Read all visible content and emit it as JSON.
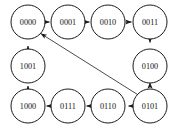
{
  "diagram": {
    "background_color": "#ffffff",
    "stroke_color": "#1a1a1a",
    "label_color": "#111111",
    "node_radius": 17,
    "nodes": [
      {
        "id": "n0000",
        "label": "0000",
        "cx": 28,
        "cy": 22
      },
      {
        "id": "n0001",
        "label": "0001",
        "cx": 68,
        "cy": 22
      },
      {
        "id": "n0010",
        "label": "0010",
        "cx": 108,
        "cy": 22
      },
      {
        "id": "n0011",
        "label": "0011",
        "cx": 150,
        "cy": 22
      },
      {
        "id": "n0100",
        "label": "0100",
        "cx": 150,
        "cy": 66
      },
      {
        "id": "n0101",
        "label": "0101",
        "cx": 150,
        "cy": 106
      },
      {
        "id": "n0110",
        "label": "0110",
        "cx": 108,
        "cy": 106
      },
      {
        "id": "n0111",
        "label": "0111",
        "cx": 68,
        "cy": 106
      },
      {
        "id": "n1000",
        "label": "1000",
        "cx": 28,
        "cy": 106
      },
      {
        "id": "n1001",
        "label": "1001",
        "cx": 28,
        "cy": 66
      }
    ],
    "edges": [
      {
        "id": "e1",
        "from": "0000",
        "to": "0001",
        "direction": "right"
      },
      {
        "id": "e2",
        "from": "0001",
        "to": "0010",
        "direction": "right"
      },
      {
        "id": "e3",
        "from": "0010",
        "to": "0011",
        "direction": "right"
      },
      {
        "id": "e4",
        "from": "0011",
        "to": "0100",
        "direction": "down"
      },
      {
        "id": "e5",
        "from": "0100",
        "to": "0101",
        "direction": "down"
      },
      {
        "id": "e6",
        "from": "0101",
        "to": "0110",
        "direction": "left"
      },
      {
        "id": "e7",
        "from": "0110",
        "to": "0111",
        "direction": "left"
      },
      {
        "id": "e8",
        "from": "0111",
        "to": "1000",
        "direction": "left"
      },
      {
        "id": "e9",
        "from": "1000",
        "to": "1001",
        "direction": "up"
      },
      {
        "id": "e10",
        "from": "1001",
        "to": "0000",
        "direction": "up"
      },
      {
        "id": "e11",
        "from": "0101",
        "to": "0000",
        "direction": "diagonal-up-left"
      }
    ]
  }
}
